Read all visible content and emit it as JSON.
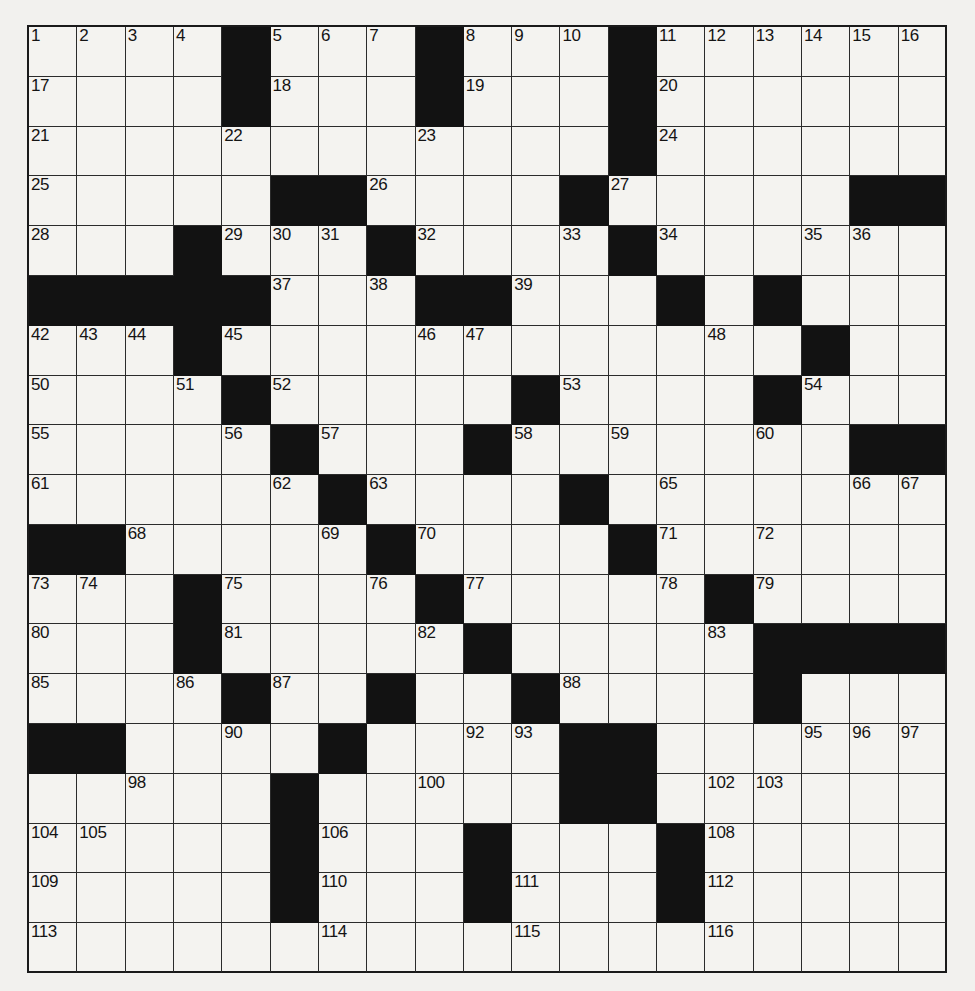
{
  "puzzle": {
    "type": "crossword-grid",
    "rows": 19,
    "cols": 19,
    "colors": {
      "cell_fill": "#f4f3f0",
      "block_fill": "#121212",
      "grid_line": "#2b2b2b",
      "page_bg": "#f2f1ee"
    },
    "blocks": [
      [
        0,
        4
      ],
      [
        0,
        8
      ],
      [
        0,
        12
      ],
      [
        1,
        4
      ],
      [
        1,
        8
      ],
      [
        1,
        12
      ],
      [
        2,
        12
      ],
      [
        3,
        5
      ],
      [
        3,
        6
      ],
      [
        3,
        11
      ],
      [
        3,
        17
      ],
      [
        3,
        18
      ],
      [
        4,
        3
      ],
      [
        4,
        7
      ],
      [
        4,
        12
      ],
      [
        5,
        0
      ],
      [
        5,
        1
      ],
      [
        5,
        2
      ],
      [
        5,
        3
      ],
      [
        5,
        4
      ],
      [
        5,
        8
      ],
      [
        5,
        9
      ],
      [
        5,
        13
      ],
      [
        5,
        15
      ],
      [
        6,
        3
      ],
      [
        6,
        16
      ],
      [
        6,
        3
      ],
      [
        7,
        4
      ],
      [
        7,
        10
      ],
      [
        7,
        15
      ],
      [
        8,
        5
      ],
      [
        8,
        9
      ],
      [
        8,
        17
      ],
      [
        8,
        18
      ],
      [
        9,
        6
      ],
      [
        9,
        11
      ],
      [
        10,
        0
      ],
      [
        10,
        1
      ],
      [
        10,
        7
      ],
      [
        10,
        12
      ],
      [
        11,
        3
      ],
      [
        11,
        8
      ],
      [
        11,
        14
      ],
      [
        12,
        3
      ],
      [
        12,
        9
      ],
      [
        12,
        15
      ],
      [
        12,
        16
      ],
      [
        12,
        17
      ],
      [
        12,
        18
      ],
      [
        13,
        4
      ],
      [
        13,
        7
      ],
      [
        13,
        10
      ],
      [
        13,
        15
      ],
      [
        14,
        0
      ],
      [
        14,
        1
      ],
      [
        14,
        6
      ],
      [
        14,
        11
      ],
      [
        14,
        12
      ],
      [
        15,
        5
      ],
      [
        15,
        11
      ],
      [
        15,
        12
      ],
      [
        16,
        5
      ],
      [
        16,
        9
      ],
      [
        16,
        13
      ],
      [
        17,
        5
      ],
      [
        17,
        9
      ],
      [
        17,
        13
      ]
    ],
    "numbers": [
      {
        "r": 0,
        "c": 0,
        "n": "1"
      },
      {
        "r": 0,
        "c": 1,
        "n": "2"
      },
      {
        "r": 0,
        "c": 2,
        "n": "3"
      },
      {
        "r": 0,
        "c": 3,
        "n": "4"
      },
      {
        "r": 0,
        "c": 5,
        "n": "5"
      },
      {
        "r": 0,
        "c": 6,
        "n": "6"
      },
      {
        "r": 0,
        "c": 7,
        "n": "7"
      },
      {
        "r": 0,
        "c": 9,
        "n": "8"
      },
      {
        "r": 0,
        "c": 10,
        "n": "9"
      },
      {
        "r": 0,
        "c": 11,
        "n": "10"
      },
      {
        "r": 0,
        "c": 13,
        "n": "11"
      },
      {
        "r": 0,
        "c": 14,
        "n": "12"
      },
      {
        "r": 0,
        "c": 15,
        "n": "13"
      },
      {
        "r": 0,
        "c": 16,
        "n": "14"
      },
      {
        "r": 0,
        "c": 17,
        "n": "15"
      },
      {
        "r": 0,
        "c": 18,
        "n": "16"
      },
      {
        "r": 1,
        "c": 0,
        "n": "17"
      },
      {
        "r": 1,
        "c": 5,
        "n": "18"
      },
      {
        "r": 1,
        "c": 9,
        "n": "19"
      },
      {
        "r": 1,
        "c": 13,
        "n": "20"
      },
      {
        "r": 2,
        "c": 0,
        "n": "21"
      },
      {
        "r": 2,
        "c": 4,
        "n": "22"
      },
      {
        "r": 2,
        "c": 8,
        "n": "23"
      },
      {
        "r": 2,
        "c": 13,
        "n": "24"
      },
      {
        "r": 3,
        "c": 0,
        "n": "25"
      },
      {
        "r": 3,
        "c": 7,
        "n": "26"
      },
      {
        "r": 3,
        "c": 12,
        "n": "27"
      },
      {
        "r": 4,
        "c": 0,
        "n": "28"
      },
      {
        "r": 4,
        "c": 4,
        "n": "29"
      },
      {
        "r": 4,
        "c": 5,
        "n": "30"
      },
      {
        "r": 4,
        "c": 6,
        "n": "31"
      },
      {
        "r": 4,
        "c": 8,
        "n": "32"
      },
      {
        "r": 4,
        "c": 11,
        "n": "33"
      },
      {
        "r": 4,
        "c": 13,
        "n": "34"
      },
      {
        "r": 4,
        "c": 16,
        "n": "35"
      },
      {
        "r": 4,
        "c": 17,
        "n": "36"
      },
      {
        "r": 5,
        "c": 5,
        "n": "37"
      },
      {
        "r": 5,
        "c": 7,
        "n": "38"
      },
      {
        "r": 5,
        "c": 10,
        "n": "39"
      },
      {
        "r": 5,
        "c": 13,
        "n": "40"
      },
      {
        "r": 5,
        "c": 15,
        "n": "41"
      },
      {
        "r": 6,
        "c": 0,
        "n": "42"
      },
      {
        "r": 6,
        "c": 1,
        "n": "43"
      },
      {
        "r": 6,
        "c": 2,
        "n": "44"
      },
      {
        "r": 6,
        "c": 4,
        "n": "45"
      },
      {
        "r": 6,
        "c": 8,
        "n": "46"
      },
      {
        "r": 6,
        "c": 9,
        "n": "47"
      },
      {
        "r": 6,
        "c": 14,
        "n": "48"
      },
      {
        "r": 6,
        "c": 16,
        "n": "49"
      },
      {
        "r": 7,
        "c": 0,
        "n": "50"
      },
      {
        "r": 7,
        "c": 3,
        "n": "51"
      },
      {
        "r": 7,
        "c": 5,
        "n": "52"
      },
      {
        "r": 7,
        "c": 11,
        "n": "53"
      },
      {
        "r": 7,
        "c": 16,
        "n": "54"
      },
      {
        "r": 8,
        "c": 0,
        "n": "55"
      },
      {
        "r": 8,
        "c": 4,
        "n": "56"
      },
      {
        "r": 8,
        "c": 6,
        "n": "57"
      },
      {
        "r": 8,
        "c": 10,
        "n": "58"
      },
      {
        "r": 8,
        "c": 12,
        "n": "59"
      },
      {
        "r": 8,
        "c": 15,
        "n": "60"
      },
      {
        "r": 9,
        "c": 0,
        "n": "61"
      },
      {
        "r": 9,
        "c": 5,
        "n": "62"
      },
      {
        "r": 9,
        "c": 7,
        "n": "63"
      },
      {
        "r": 9,
        "c": 11,
        "n": "64"
      },
      {
        "r": 9,
        "c": 13,
        "n": "65"
      },
      {
        "r": 9,
        "c": 17,
        "n": "66"
      },
      {
        "r": 9,
        "c": 18,
        "n": "67"
      },
      {
        "r": 10,
        "c": 2,
        "n": "68"
      },
      {
        "r": 10,
        "c": 6,
        "n": "69"
      },
      {
        "r": 10,
        "c": 8,
        "n": "70"
      },
      {
        "r": 10,
        "c": 13,
        "n": "71"
      },
      {
        "r": 10,
        "c": 15,
        "n": "72"
      },
      {
        "r": 11,
        "c": 0,
        "n": "73"
      },
      {
        "r": 11,
        "c": 1,
        "n": "74"
      },
      {
        "r": 11,
        "c": 4,
        "n": "75"
      },
      {
        "r": 11,
        "c": 7,
        "n": "76"
      },
      {
        "r": 11,
        "c": 9,
        "n": "77"
      },
      {
        "r": 11,
        "c": 13,
        "n": "78"
      },
      {
        "r": 11,
        "c": 15,
        "n": "79"
      },
      {
        "r": 12,
        "c": 0,
        "n": "80"
      },
      {
        "r": 12,
        "c": 4,
        "n": "81"
      },
      {
        "r": 12,
        "c": 8,
        "n": "82"
      },
      {
        "r": 12,
        "c": 14,
        "n": "83"
      },
      {
        "r": 12,
        "c": 16,
        "n": "84"
      },
      {
        "r": 13,
        "c": 0,
        "n": "85"
      },
      {
        "r": 13,
        "c": 3,
        "n": "86"
      },
      {
        "r": 13,
        "c": 5,
        "n": "87"
      },
      {
        "r": 13,
        "c": 11,
        "n": "88"
      },
      {
        "r": 14,
        "c": 0,
        "n": "89"
      },
      {
        "r": 14,
        "c": 4,
        "n": "90"
      },
      {
        "r": 14,
        "c": 6,
        "n": "91"
      },
      {
        "r": 14,
        "c": 9,
        "n": "92"
      },
      {
        "r": 14,
        "c": 10,
        "n": "93"
      },
      {
        "r": 14,
        "c": 12,
        "n": "94"
      },
      {
        "r": 14,
        "c": 16,
        "n": "95"
      },
      {
        "r": 14,
        "c": 17,
        "n": "96"
      },
      {
        "r": 14,
        "c": 18,
        "n": "97"
      },
      {
        "r": 15,
        "c": 2,
        "n": "98"
      },
      {
        "r": 15,
        "c": 5,
        "n": "99"
      },
      {
        "r": 15,
        "c": 8,
        "n": "100"
      },
      {
        "r": 15,
        "c": 11,
        "n": "101"
      },
      {
        "r": 15,
        "c": 14,
        "n": "102"
      },
      {
        "r": 15,
        "c": 15,
        "n": "103"
      },
      {
        "r": 16,
        "c": 0,
        "n": "104"
      },
      {
        "r": 16,
        "c": 1,
        "n": "105"
      },
      {
        "r": 16,
        "c": 6,
        "n": "106"
      },
      {
        "r": 16,
        "c": 13,
        "n": "107"
      },
      {
        "r": 16,
        "c": 14,
        "n": "108"
      },
      {
        "r": 17,
        "c": 0,
        "n": "109"
      },
      {
        "r": 17,
        "c": 6,
        "n": "110"
      },
      {
        "r": 17,
        "c": 10,
        "n": "111"
      },
      {
        "r": 17,
        "c": 14,
        "n": "112"
      },
      {
        "r": 18,
        "c": 0,
        "n": "113"
      },
      {
        "r": 18,
        "c": 6,
        "n": "114"
      },
      {
        "r": 18,
        "c": 10,
        "n": "115"
      },
      {
        "r": 18,
        "c": 14,
        "n": "116"
      }
    ]
  }
}
